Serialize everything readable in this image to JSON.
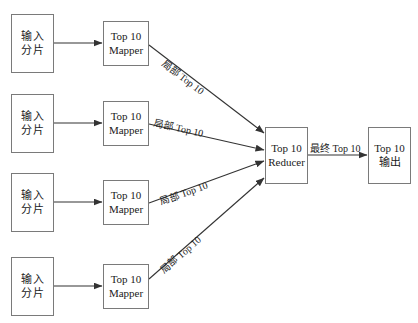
{
  "diagram": {
    "background_color": "#ffffff",
    "stroke_color": "#7a7a7a",
    "arrow_color": "#333333",
    "text_color": "#1a1a1a",
    "inputs": [
      {
        "line1": "输入",
        "line2": "分片"
      },
      {
        "line1": "输入",
        "line2": "分片"
      },
      {
        "line1": "输入",
        "line2": "分片"
      },
      {
        "line1": "输入",
        "line2": "分片"
      }
    ],
    "mappers": [
      {
        "line1": "Top 10",
        "line2": "Mapper"
      },
      {
        "line1": "Top 10",
        "line2": "Mapper"
      },
      {
        "line1": "Top 10",
        "line2": "Mapper"
      },
      {
        "line1": "Top 10",
        "line2": "Mapper"
      }
    ],
    "reducer": {
      "line1": "Top 10",
      "line2": "Reducer"
    },
    "output": {
      "line1": "Top 10",
      "line2": "输出"
    },
    "partial_labels": [
      "局部 Top 10",
      "局部 Top 10",
      "局部 Top 10",
      "局部 Top 10"
    ],
    "final_label": "最终 Top 10"
  }
}
